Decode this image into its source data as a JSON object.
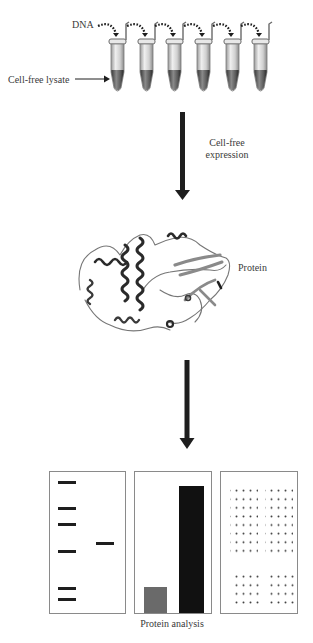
{
  "diagram": {
    "step1": {
      "dna_label": "DNA",
      "lysate_label": "Cell-free lysate",
      "tube_count": 6
    },
    "arrow1": {
      "label_line1": "Cell-free",
      "label_line2": "expression"
    },
    "step2": {
      "protein_label": "Protein"
    },
    "arrow2": {
      "label": ""
    },
    "step3": {
      "caption": "Protein analysis",
      "panels": [
        {
          "type": "gel",
          "ladder_band_y": [
            481,
            507,
            523,
            550,
            587,
            598
          ],
          "sample_band_y": [
            542
          ]
        },
        {
          "type": "bar",
          "bars": [
            {
              "name": "low",
              "relative_height": 0.21,
              "color": "#6a6a6a"
            },
            {
              "name": "high",
              "relative_height": 0.98,
              "color": "#111111"
            }
          ]
        },
        {
          "type": "microarray",
          "grids": [
            {
              "position": "top-left",
              "cols": 4,
              "rows": 8
            },
            {
              "position": "top-right",
              "cols": 4,
              "rows": 8
            },
            {
              "position": "bottom-left",
              "cols": 4,
              "rows": 4
            },
            {
              "position": "bottom-right",
              "cols": 4,
              "rows": 4
            }
          ]
        }
      ]
    },
    "colors": {
      "ink": "#1e1e1e",
      "tube_body": "#d8d8d8",
      "tube_shadow": "#8a8a8a",
      "lysate": "#4a4a4a",
      "panel_border": "#8a8a8a",
      "bar_low": "#6a6a6a",
      "bar_high": "#111111"
    }
  }
}
